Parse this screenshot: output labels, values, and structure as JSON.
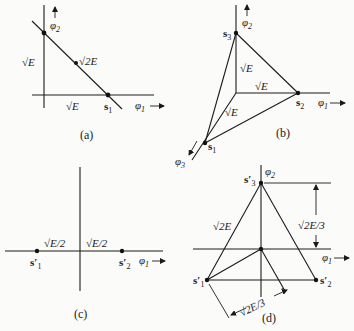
{
  "figure": {
    "panels": [
      {
        "id": "a",
        "caption": "(a)",
        "axes": {
          "x": "φ",
          "x_sub": "1",
          "y": "φ",
          "y_sub": "2"
        },
        "points": [
          {
            "label": "s",
            "sub": "1"
          }
        ],
        "distances": [
          "√E",
          "√2E",
          "√E"
        ]
      },
      {
        "id": "b",
        "caption": "(b)",
        "axes": {
          "x": "φ",
          "x_sub": "1",
          "y": "φ",
          "y_sub": "2",
          "z": "φ",
          "z_sub": "3"
        },
        "points": [
          {
            "label": "s",
            "sub": "1"
          },
          {
            "label": "s",
            "sub": "2"
          },
          {
            "label": "s",
            "sub": "3"
          }
        ],
        "distances": [
          "√E",
          "√E",
          "√E"
        ]
      },
      {
        "id": "c",
        "caption": "(c)",
        "axes": {
          "x": "φ",
          "x_sub": "1"
        },
        "points": [
          {
            "label": "s′",
            "sub": "1"
          },
          {
            "label": "s′",
            "sub": "2"
          }
        ],
        "distances": [
          "√E/2",
          "√E/2"
        ]
      },
      {
        "id": "d",
        "caption": "(d)",
        "axes": {
          "x": "φ",
          "x_sub": "1",
          "y": "φ",
          "y_sub": "2"
        },
        "points": [
          {
            "label": "s′",
            "sub": "1"
          },
          {
            "label": "s′",
            "sub": "2"
          },
          {
            "label": "s′",
            "sub": "3"
          }
        ],
        "distances": [
          "√2E",
          "√2E/3",
          "√2E/3"
        ]
      }
    ]
  }
}
